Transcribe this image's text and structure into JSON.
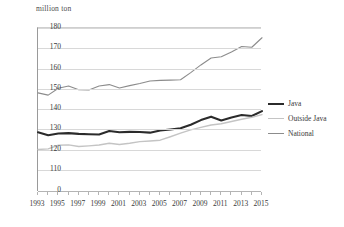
{
  "chart_data": {
    "type": "line",
    "title": "",
    "axis_unit_label": "million ton",
    "xlabel": "",
    "ylabel": "million ton",
    "grid": true,
    "legend_position": "right",
    "xlim": [
      1993,
      2015
    ],
    "ylim": [
      110,
      180
    ],
    "y_axis_has_break": true,
    "y_ticks": [
      0,
      110,
      120,
      130,
      140,
      150,
      160,
      170,
      180
    ],
    "x_ticks": [
      1993,
      1995,
      1997,
      1999,
      2001,
      2003,
      2005,
      2007,
      2009,
      2011,
      2013,
      2015
    ],
    "x": [
      1993,
      1994,
      1995,
      1996,
      1997,
      1998,
      1999,
      2000,
      2001,
      2002,
      2003,
      2004,
      2005,
      2006,
      2007,
      2008,
      2009,
      2010,
      2011,
      2012,
      2013,
      2014,
      2015
    ],
    "series": [
      {
        "name": "Java",
        "color": "#2b2b2b",
        "width": 2.1,
        "values": [
          128.6,
          127.1,
          128.0,
          128.2,
          127.8,
          127.6,
          127.5,
          129.2,
          128.6,
          128.8,
          128.7,
          128.4,
          129.5,
          130.0,
          130.6,
          132.3,
          134.6,
          136.3,
          134.4,
          135.9,
          137.1,
          136.6,
          139.0
        ]
      },
      {
        "name": "Outside Java",
        "color": "#c4c4c4",
        "width": 1.4,
        "values": [
          120.1,
          120.4,
          122.2,
          122.4,
          121.6,
          121.9,
          122.3,
          123.2,
          122.6,
          123.2,
          124.0,
          124.3,
          124.7,
          126.4,
          128.2,
          129.8,
          131.0,
          132.2,
          132.8,
          133.9,
          135.0,
          136.0,
          137.3
        ]
      },
      {
        "name": "National",
        "color": "#8c8c8c",
        "width": 1.1,
        "values": [
          148.0,
          146.9,
          150.3,
          151.4,
          149.6,
          149.4,
          151.4,
          152.1,
          150.4,
          151.6,
          152.6,
          153.9,
          154.2,
          154.3,
          154.5,
          158.0,
          161.8,
          165.2,
          165.8,
          168.2,
          170.9,
          170.5,
          175.2
        ]
      }
    ]
  },
  "legend": {
    "items": [
      {
        "label": "Java"
      },
      {
        "label": "Outside Java"
      },
      {
        "label": "National"
      }
    ]
  },
  "caption": {
    "text": ""
  }
}
